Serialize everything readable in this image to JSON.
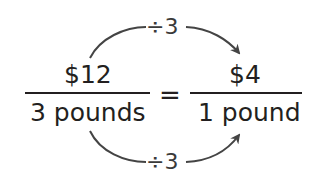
{
  "equation": {
    "left": {
      "numerator": "$12",
      "denominator": "3 pounds"
    },
    "equals": "=",
    "right": {
      "numerator": "$4",
      "denominator": "1 pound"
    }
  },
  "top_operation": {
    "label": "÷3",
    "from": "$12",
    "to": "$4"
  },
  "bottom_operation": {
    "label": "÷3",
    "from": "3 pounds",
    "to": "1 pound"
  },
  "colors": {
    "text": "#231f20",
    "arrow": "#444444",
    "background": "#ffffff"
  }
}
